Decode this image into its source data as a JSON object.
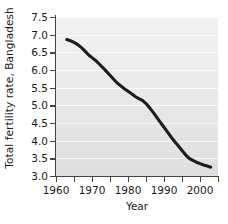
{
  "chart_data": {
    "type": "line",
    "title": "",
    "xlabel": "Year",
    "ylabel": "Total fertility rate, Bangladesh",
    "xlim": [
      1960,
      2005
    ],
    "ylim": [
      3.0,
      7.5
    ],
    "grid": true,
    "grid_orientation": "horizontal",
    "legend": "none",
    "line_color": "#1c1c1c",
    "plot_background": "#e8e8e8",
    "gridline_color": "#ffffff",
    "x_ticks_major": [
      1960,
      1970,
      1980,
      1990,
      2000
    ],
    "x_ticks_minor": [
      1965,
      1975,
      1985,
      1995,
      2005
    ],
    "x_tick_labels": [
      "1960",
      "1970",
      "1980",
      "1990",
      "2000"
    ],
    "y_ticks": [
      3.0,
      3.5,
      4.0,
      4.5,
      5.0,
      5.5,
      6.0,
      6.5,
      7.0,
      7.5
    ],
    "y_tick_labels": [
      "3.0",
      "3.5",
      "4.0",
      "4.5",
      "5.0",
      "5.5",
      "6.0",
      "6.5",
      "7.0",
      "7.5"
    ],
    "series": [
      {
        "name": "Total fertility rate, Bangladesh",
        "x": [
          1963,
          1964,
          1965,
          1966,
          1967,
          1968,
          1969,
          1970,
          1971,
          1972,
          1973,
          1974,
          1975,
          1976,
          1977,
          1978,
          1979,
          1980,
          1981,
          1982,
          1983,
          1984,
          1985,
          1986,
          1987,
          1988,
          1989,
          1990,
          1991,
          1992,
          1993,
          1994,
          1995,
          1996,
          1997,
          1998,
          1999,
          2000,
          2001,
          2002,
          2003
        ],
        "values": [
          6.86,
          6.83,
          6.78,
          6.72,
          6.64,
          6.54,
          6.43,
          6.35,
          6.27,
          6.17,
          6.07,
          5.96,
          5.85,
          5.74,
          5.63,
          5.55,
          5.47,
          5.4,
          5.33,
          5.25,
          5.19,
          5.14,
          5.05,
          4.93,
          4.8,
          4.66,
          4.52,
          4.38,
          4.24,
          4.1,
          3.97,
          3.85,
          3.72,
          3.6,
          3.5,
          3.44,
          3.39,
          3.35,
          3.31,
          3.28,
          3.25
        ]
      }
    ]
  }
}
